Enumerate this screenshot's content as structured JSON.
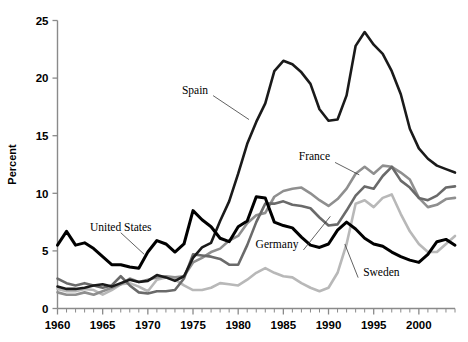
{
  "chart_data": {
    "type": "line",
    "title": "",
    "xlabel": "",
    "ylabel": "Percent",
    "xlim": [
      1960,
      2004
    ],
    "ylim": [
      0,
      25
    ],
    "grid": false,
    "legend": "inline-labels",
    "y_ticks": [
      "0",
      "5",
      "10",
      "15",
      "20",
      "25"
    ],
    "y_tick_values": [
      0,
      5,
      10,
      15,
      20,
      25
    ],
    "x_ticks": [
      "1960",
      "1965",
      "1970",
      "1975",
      "1980",
      "1985",
      "1990",
      "1995",
      "2000"
    ],
    "x_tick_values": [
      1960,
      1965,
      1970,
      1975,
      1980,
      1985,
      1990,
      1995,
      2000
    ],
    "x_minor_step": 1,
    "x": [
      1960,
      1961,
      1962,
      1963,
      1964,
      1965,
      1966,
      1967,
      1968,
      1969,
      1970,
      1971,
      1972,
      1973,
      1974,
      1975,
      1976,
      1977,
      1978,
      1979,
      1980,
      1981,
      1982,
      1983,
      1984,
      1985,
      1986,
      1987,
      1988,
      1989,
      1990,
      1991,
      1992,
      1993,
      1994,
      1995,
      1996,
      1997,
      1998,
      1999,
      2000,
      2001,
      2002,
      2003,
      2004
    ],
    "series": [
      {
        "name": "Spain",
        "color": "#1a1a1a",
        "width": 2.6,
        "label_x": 1977.0,
        "label_y": 19.0,
        "values": [
          1.9,
          1.7,
          1.7,
          1.8,
          2.0,
          2.1,
          1.9,
          2.2,
          2.5,
          2.3,
          2.4,
          2.9,
          2.7,
          2.4,
          2.8,
          4.4,
          5.3,
          5.7,
          7.6,
          9.3,
          11.7,
          14.3,
          16.2,
          17.8,
          20.6,
          21.5,
          21.2,
          20.5,
          19.5,
          17.3,
          16.3,
          16.4,
          18.5,
          22.8,
          24.0,
          22.9,
          22.1,
          20.6,
          18.6,
          15.6,
          13.9,
          13.0,
          12.4,
          12.1,
          11.8
        ]
      },
      {
        "name": "France",
        "color": "#8f8f8f",
        "width": 2.6,
        "label_x": 1990.5,
        "label_y": 13.2,
        "values": [
          1.4,
          1.2,
          1.2,
          1.4,
          1.2,
          1.5,
          1.8,
          2.1,
          2.6,
          2.3,
          2.5,
          2.7,
          2.8,
          2.7,
          2.8,
          4.0,
          4.4,
          4.9,
          5.2,
          5.9,
          6.3,
          7.4,
          8.1,
          8.3,
          9.7,
          10.2,
          10.4,
          10.5,
          10.0,
          9.4,
          8.9,
          9.5,
          10.4,
          11.7,
          12.3,
          11.7,
          12.4,
          12.3,
          11.8,
          11.2,
          9.6,
          8.8,
          9.0,
          9.5,
          9.6
        ]
      },
      {
        "name": "Germany",
        "color": "#6a6a6a",
        "width": 2.6,
        "label_x": 1987.0,
        "label_y": 5.6,
        "values": [
          2.6,
          2.2,
          2.0,
          2.2,
          2.0,
          1.8,
          2.0,
          2.8,
          2.0,
          1.4,
          1.3,
          1.5,
          1.5,
          1.6,
          2.6,
          4.7,
          4.6,
          4.5,
          4.3,
          3.8,
          3.8,
          5.5,
          7.5,
          9.1,
          9.1,
          9.3,
          9.0,
          8.9,
          8.7,
          7.9,
          7.2,
          7.3,
          8.5,
          9.8,
          10.6,
          10.4,
          11.5,
          12.3,
          11.1,
          10.5,
          9.6,
          9.4,
          9.8,
          10.5,
          10.6
        ]
      },
      {
        "name": "Sweden",
        "color": "#b8b8b8",
        "width": 2.6,
        "label_x": 1993.5,
        "label_y": 3.2,
        "values": [
          1.7,
          1.5,
          1.5,
          1.7,
          1.6,
          1.2,
          1.6,
          2.1,
          2.2,
          1.9,
          1.5,
          2.5,
          2.7,
          2.5,
          2.0,
          1.6,
          1.6,
          1.8,
          2.2,
          2.1,
          2.0,
          2.5,
          3.1,
          3.5,
          3.1,
          2.8,
          2.7,
          2.2,
          1.8,
          1.5,
          1.8,
          3.1,
          5.6,
          9.1,
          9.4,
          8.8,
          9.6,
          9.9,
          8.2,
          6.7,
          5.6,
          4.9,
          4.9,
          5.6,
          6.3
        ]
      },
      {
        "name": "United States",
        "color": "#000000",
        "width": 3.0,
        "label_x": 1967.0,
        "label_y": 7.1,
        "values": [
          5.5,
          6.7,
          5.5,
          5.7,
          5.2,
          4.5,
          3.8,
          3.8,
          3.6,
          3.5,
          4.9,
          5.9,
          5.6,
          4.9,
          5.6,
          8.5,
          7.7,
          7.1,
          6.1,
          5.8,
          7.1,
          7.6,
          9.7,
          9.6,
          7.5,
          7.2,
          7.0,
          6.2,
          5.5,
          5.3,
          5.6,
          6.8,
          7.5,
          6.9,
          6.1,
          5.6,
          5.4,
          4.9,
          4.5,
          4.2,
          4.0,
          4.7,
          5.8,
          6.0,
          5.5
        ]
      }
    ],
    "annotations": [
      {
        "text": "Spain",
        "x": 1977.0,
        "y": 19.0
      },
      {
        "text": "France",
        "x": 1990.5,
        "y": 13.2
      },
      {
        "text": "Germany",
        "x": 1987.0,
        "y": 5.6
      },
      {
        "text": "Sweden",
        "x": 1993.5,
        "y": 3.2
      },
      {
        "text": "United States",
        "x": 1967.0,
        "y": 7.1
      }
    ]
  },
  "axes": {
    "y_title": "Percent"
  }
}
